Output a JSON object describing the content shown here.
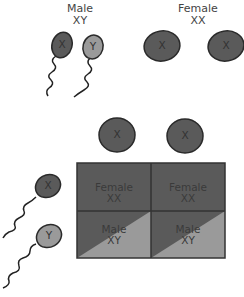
{
  "parents": {
    "male": {
      "title": "Male",
      "genotype": "XY",
      "gametes": [
        "X",
        "Y"
      ]
    },
    "female": {
      "title": "Female",
      "genotype": "XX",
      "gametes": [
        "X",
        "X"
      ]
    }
  },
  "punnett": {
    "column_gametes": [
      "X",
      "X"
    ],
    "row_gametes": [
      "X",
      "Y"
    ],
    "cells": [
      [
        {
          "sex": "Female",
          "genotype": "XX"
        },
        {
          "sex": "Female",
          "genotype": "XX"
        }
      ],
      [
        {
          "sex": "Male",
          "genotype": "XY"
        },
        {
          "sex": "Male",
          "genotype": "XY"
        }
      ]
    ]
  },
  "colors": {
    "x_chromosome": "#5a5a5a",
    "y_chromosome": "#9a9a9a",
    "outline": "#2a2a2a",
    "grid_line": "#333333"
  }
}
